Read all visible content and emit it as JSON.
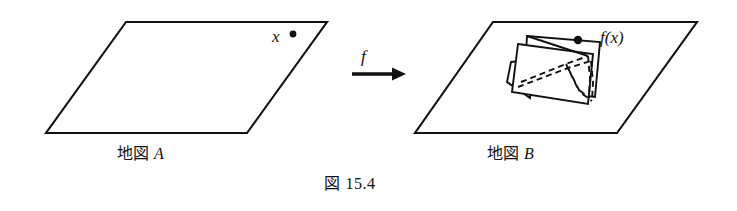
{
  "figure": {
    "caption": "図 15.4",
    "caption_label_cjk": "図",
    "caption_number": "15.4",
    "background_color": "#ffffff",
    "ink_color": "#111111"
  },
  "domain_map": {
    "name_cjk": "地図",
    "name_letter": "A",
    "caption": "地図 A",
    "point_label": "x",
    "point_marker": "dot-marker",
    "shape": "parallelogram"
  },
  "codomain_map": {
    "name_cjk": "地図",
    "name_letter": "B",
    "caption": "地図 B",
    "point_label": "f(x)",
    "point_marker": "dot-marker",
    "shape": "parallelogram",
    "inset_shapes": "two overlapping quadrilaterals with dashed correspondence lines"
  },
  "mapping_arrow": {
    "label": "f",
    "direction": "right",
    "icon": "right-arrow-icon"
  },
  "geometry": {
    "parallelogram_a": "126,22 327,22 247,133 46,133",
    "parallelogram_b": "493,22 697,22 617,133 415,133",
    "point_x": {
      "cx": 293,
      "cy": 34,
      "r": 3.2
    },
    "point_fx": {
      "cx": 578,
      "cy": 39,
      "r": 4.0
    },
    "inset_quad_front": "519,43 594,53 588,103 512,92",
    "inset_quad_back": "528,37 599,41 594,96 524,88",
    "inset_quad_flap": "511,63 531,61 528,96 508,83",
    "dashed_lines": [
      "519,85 568,66 590,60",
      "521,82 566,63 588,56",
      "568,66 580,90 590,99",
      "566,63 578,88 588,96",
      "590,60 592,80 591,98",
      "588,56 590,78 589,96"
    ],
    "arrow": {
      "x1": 352,
      "y1": 74,
      "x2": 404,
      "y2": 74
    }
  }
}
